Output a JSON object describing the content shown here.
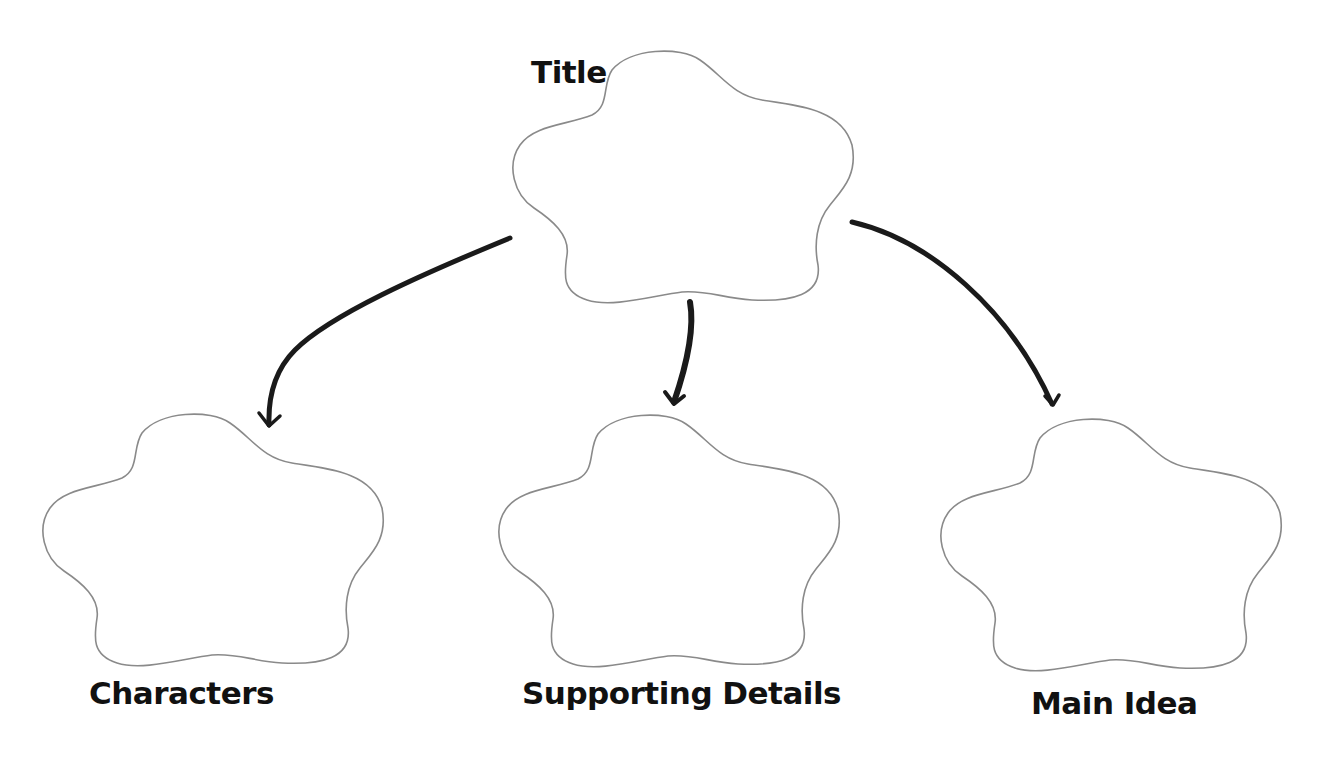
{
  "diagram": {
    "type": "graphic-organizer",
    "colors": {
      "background": "#ffffff",
      "shape_outline": "#8a8a8a",
      "arrow": "#1a1a1a",
      "text": "#111111"
    },
    "nodes": [
      {
        "id": "title",
        "label": "Title",
        "shape": "flower"
      },
      {
        "id": "characters",
        "label": "Characters",
        "shape": "flower"
      },
      {
        "id": "supporting-details",
        "label": "Supporting Details",
        "shape": "flower"
      },
      {
        "id": "main-idea",
        "label": "Main Idea",
        "shape": "flower"
      }
    ],
    "edges": [
      {
        "from": "title",
        "to": "characters"
      },
      {
        "from": "title",
        "to": "supporting-details"
      },
      {
        "from": "title",
        "to": "main-idea"
      }
    ]
  }
}
